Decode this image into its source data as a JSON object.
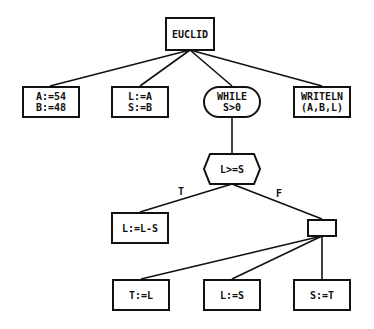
{
  "diagram": {
    "type": "structure-tree",
    "root": {
      "id": "euclid",
      "label": "EUCLID"
    },
    "nodes": {
      "euclid": {
        "lines": [
          "EUCLID"
        ],
        "shape": "rect"
      },
      "init_ab": {
        "lines": [
          "A:=54",
          "B:=48"
        ],
        "shape": "rect"
      },
      "init_ls": {
        "lines": [
          "L:=A",
          "S:=B"
        ],
        "shape": "rect"
      },
      "while": {
        "lines": [
          "WHILE",
          "S>0"
        ],
        "shape": "rounded"
      },
      "writeln": {
        "lines": [
          "WRITELN",
          "(A,B,L)"
        ],
        "shape": "rect"
      },
      "cond": {
        "lines": [
          "L>=S"
        ],
        "shape": "hexagon"
      },
      "sub": {
        "lines": [
          "L:=L-S"
        ],
        "shape": "rect"
      },
      "block": {
        "lines": [
          ""
        ],
        "shape": "rect-empty"
      },
      "t_l": {
        "lines": [
          "T:=L"
        ],
        "shape": "rect"
      },
      "l_s": {
        "lines": [
          "L:=S"
        ],
        "shape": "rect"
      },
      "s_t": {
        "lines": [
          "S:=T"
        ],
        "shape": "rect"
      }
    },
    "edges": [
      {
        "from": "euclid",
        "to": "init_ab"
      },
      {
        "from": "euclid",
        "to": "init_ls"
      },
      {
        "from": "euclid",
        "to": "while"
      },
      {
        "from": "euclid",
        "to": "writeln"
      },
      {
        "from": "while",
        "to": "cond"
      },
      {
        "from": "cond",
        "to": "sub",
        "label": "T"
      },
      {
        "from": "cond",
        "to": "block",
        "label": "F"
      },
      {
        "from": "block",
        "to": "t_l"
      },
      {
        "from": "block",
        "to": "l_s"
      },
      {
        "from": "block",
        "to": "s_t"
      }
    ],
    "edge_labels": {
      "true": "T",
      "false": "F"
    }
  }
}
